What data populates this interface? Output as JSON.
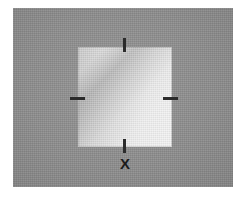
{
  "figure": {
    "kind": "annotated-image-region",
    "canvas": {
      "width": 247,
      "height": 203,
      "background_color": "#ffffff"
    },
    "panel": {
      "name": "gray-backdrop-plate",
      "color": "#8d8d8d",
      "x": 13,
      "y": 8,
      "width": 220,
      "height": 179
    },
    "region": {
      "name": "bright-square-region",
      "x": 78,
      "y": 47,
      "width": 94,
      "height": 100,
      "fill_description": "light gray square with diagonal shading band, brightest toward upper right",
      "color_light": "#f2f2f2",
      "color_mid": "#e6e6e6",
      "color_dark": "#c9c9c9",
      "band_color": "#9a9a9a"
    },
    "ticks": [
      {
        "id": "top",
        "orientation": "vertical",
        "x": 123,
        "y": 38,
        "length": 14,
        "thickness": 3,
        "color": "#2b2b2b"
      },
      {
        "id": "left",
        "orientation": "horizontal",
        "x": 70,
        "y": 97,
        "length": 15,
        "thickness": 3,
        "color": "#2b2b2b"
      },
      {
        "id": "right",
        "orientation": "horizontal",
        "x": 163,
        "y": 97,
        "length": 15,
        "thickness": 3,
        "color": "#2b2b2b"
      },
      {
        "id": "bottom",
        "orientation": "vertical",
        "x": 123,
        "y": 139,
        "length": 14,
        "thickness": 3,
        "color": "#2b2b2b"
      }
    ],
    "labels": {
      "x_marker": "X"
    }
  }
}
